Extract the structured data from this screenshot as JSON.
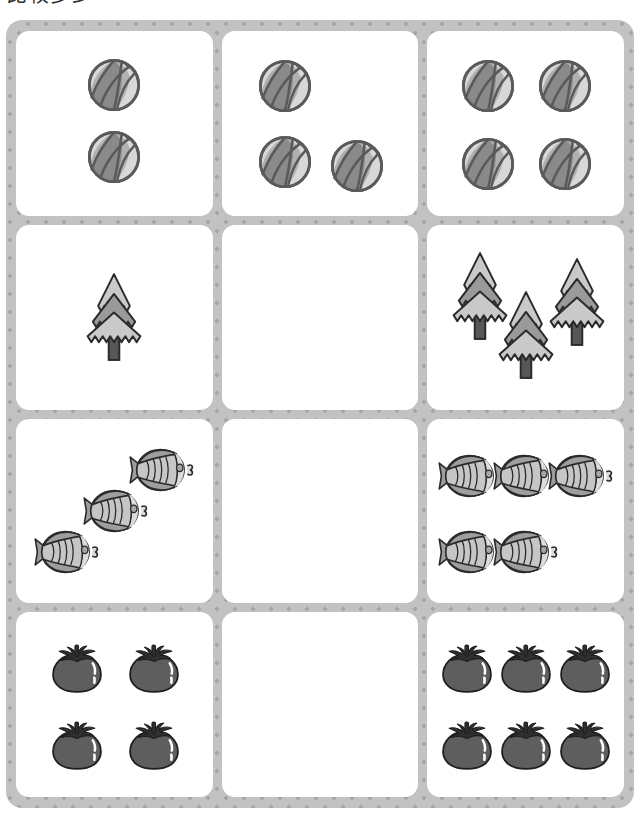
{
  "worksheet": {
    "title_partial": "比较多少",
    "background_color": "#c2c2c2",
    "dot_color": "#a6a6a6",
    "card_color": "#ffffff"
  },
  "palette": {
    "ball_dark": "#8a8a8a",
    "ball_mid": "#b0b0b0",
    "ball_light": "#d8d8d8",
    "ball_outline": "#5a5a5a",
    "tree_light": "#c9c9c9",
    "tree_dark": "#9a9a9a",
    "tree_trunk": "#575757",
    "tree_outline": "#2b2b2b",
    "fish_body": "#c6c6c6",
    "fish_dark": "#9e9e9e",
    "fish_face": "#dcdcdc",
    "fish_outline": "#2b2b2b",
    "tomato_body": "#5e5e5e",
    "tomato_calyx": "#2f2f2f",
    "tomato_outline": "#1f1f1f",
    "tomato_highlight": "#ffffff"
  },
  "grid": {
    "columns": 3,
    "rows": 4,
    "cells": [
      {
        "row": 1,
        "col": 1,
        "name": "balls-two",
        "icon": "beach-ball-icon",
        "count": 2,
        "empty": false,
        "positions": [
          [
            50,
            29
          ],
          [
            50,
            68
          ]
        ]
      },
      {
        "row": 1,
        "col": 2,
        "name": "balls-three",
        "icon": "beach-ball-icon",
        "count": 3,
        "empty": false,
        "positions": [
          [
            32,
            30
          ],
          [
            32,
            71
          ],
          [
            69,
            73
          ]
        ]
      },
      {
        "row": 1,
        "col": 3,
        "name": "balls-four",
        "icon": "beach-ball-icon",
        "count": 4,
        "empty": false,
        "positions": [
          [
            31,
            30
          ],
          [
            70,
            30
          ],
          [
            31,
            72
          ],
          [
            70,
            72
          ]
        ]
      },
      {
        "row": 2,
        "col": 1,
        "name": "trees-one",
        "icon": "fir-tree-icon",
        "count": 1,
        "empty": false,
        "positions": [
          [
            50,
            52
          ]
        ]
      },
      {
        "row": 2,
        "col": 2,
        "name": "trees-answer-blank",
        "icon": "fir-tree-icon",
        "count": 0,
        "empty": true,
        "positions": []
      },
      {
        "row": 2,
        "col": 3,
        "name": "trees-three",
        "icon": "fir-tree-icon",
        "count": 3,
        "empty": false,
        "positions": [
          [
            27,
            41
          ],
          [
            50,
            62
          ],
          [
            76,
            44
          ]
        ]
      },
      {
        "row": 3,
        "col": 1,
        "name": "fish-three",
        "icon": "fish-icon",
        "count": 3,
        "empty": false,
        "positions": [
          [
            74,
            28
          ],
          [
            51,
            50
          ],
          [
            26,
            72
          ]
        ]
      },
      {
        "row": 3,
        "col": 2,
        "name": "fish-answer-blank",
        "icon": "fish-icon",
        "count": 0,
        "empty": true,
        "positions": []
      },
      {
        "row": 3,
        "col": 3,
        "name": "fish-five",
        "icon": "fish-icon",
        "count": 5,
        "empty": false,
        "positions": [
          [
            22,
            31
          ],
          [
            50,
            31
          ],
          [
            78,
            31
          ],
          [
            22,
            72
          ],
          [
            50,
            72
          ]
        ]
      },
      {
        "row": 4,
        "col": 1,
        "name": "tomatoes-four",
        "icon": "tomato-icon",
        "count": 4,
        "empty": false,
        "positions": [
          [
            31,
            30
          ],
          [
            70,
            30
          ],
          [
            31,
            72
          ],
          [
            70,
            72
          ]
        ]
      },
      {
        "row": 4,
        "col": 2,
        "name": "tomatoes-answer-blank",
        "icon": "tomato-icon",
        "count": 0,
        "empty": true,
        "positions": []
      },
      {
        "row": 4,
        "col": 3,
        "name": "tomatoes-six",
        "icon": "tomato-icon",
        "count": 6,
        "empty": false,
        "positions": [
          [
            20,
            30
          ],
          [
            50,
            30
          ],
          [
            80,
            30
          ],
          [
            20,
            72
          ],
          [
            50,
            72
          ],
          [
            80,
            72
          ]
        ]
      }
    ]
  }
}
